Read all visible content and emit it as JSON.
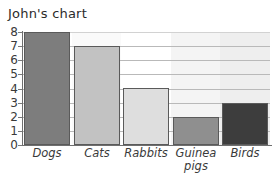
{
  "chart_data": {
    "type": "bar",
    "title": "John's chart",
    "xlabel": "",
    "ylabel": "",
    "categories": [
      "Dogs",
      "Cats",
      "Rabbits",
      "Guinea pigs",
      "Birds"
    ],
    "values": [
      8,
      7,
      4,
      2,
      3
    ],
    "ylim": [
      0,
      8
    ],
    "ytick_labels": [
      "8",
      "7",
      "6",
      "5",
      "4",
      "3",
      "2",
      "1",
      "0"
    ],
    "ytick_values": [
      8,
      7,
      6,
      5,
      4,
      3,
      2,
      1,
      0
    ],
    "grid": true,
    "grid_orientation": "horizontal",
    "legend": false,
    "legend_position": "none",
    "bar_colors": [
      "#7d7d7d",
      "#c2c2c2",
      "#dedede",
      "#8f8f8f",
      "#3d3d3d"
    ],
    "bar_border_color": "#5a5a5a",
    "axis_color": "#6f6f6f",
    "grid_color": "#b9b9b9",
    "background_color": "#ffffff",
    "text_color": "#3a3a3a"
  },
  "labels": {
    "y0": "0",
    "y1": "1",
    "y2": "2",
    "y3": "3",
    "y4": "4",
    "y5": "5",
    "y6": "6",
    "y7": "7",
    "y8": "8",
    "cat0": "Dogs",
    "cat1": "Cats",
    "cat2": "Rabbits",
    "cat3_line1": "Guinea",
    "cat3_line2": "pigs",
    "cat4": "Birds"
  }
}
